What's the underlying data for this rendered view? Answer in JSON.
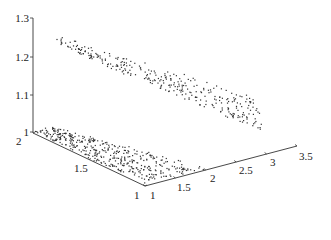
{
  "chart_data": {
    "type": "scatter3d",
    "title": "",
    "xlabel": "",
    "ylabel": "",
    "zlabel": "",
    "grid": false,
    "legend": null,
    "axes": {
      "z": {
        "range": [
          1,
          1.3
        ],
        "ticks": [
          "1",
          "1.1",
          "1.2",
          "1.3"
        ]
      },
      "x": {
        "range": [
          1,
          2
        ],
        "ticks": [
          "2",
          "1.5",
          "1"
        ]
      },
      "y": {
        "range": [
          1,
          3.5
        ],
        "ticks": [
          "1",
          "1.5",
          "2",
          "2.5",
          "3",
          "3.5"
        ]
      }
    },
    "series": [
      {
        "name": "upper-surface",
        "description": "tilted sheet of points descending from z≈1.25 at (x=2,y=1) toward z≈1.0 at large y",
        "approx_count": 320
      },
      {
        "name": "floor-plane",
        "description": "dense points on z=1 floor over x∈[1,2], y∈[1,~2]",
        "approx_count": 420
      }
    ]
  },
  "layout": {
    "z_axis_px": {
      "x": 33,
      "top": 18,
      "bottom": 132
    },
    "z_ticks_px": [
      {
        "label": "1",
        "y": 132
      },
      {
        "label": "1.1",
        "y": 95
      },
      {
        "label": "1.2",
        "y": 57
      },
      {
        "label": "1.3",
        "y": 18
      }
    ],
    "left_axis_px": {
      "x1": 33,
      "y1": 133,
      "x2": 145,
      "y2": 186
    },
    "left_ticks_px": [
      {
        "label": "2",
        "x": 16,
        "y": 145
      },
      {
        "label": "1.5",
        "x": 74,
        "y": 172
      },
      {
        "label": "1",
        "x": 134,
        "y": 199
      }
    ],
    "right_axis_px": {
      "x1": 145,
      "y1": 186,
      "x2": 297,
      "y2": 146
    },
    "right_ticks_px": [
      {
        "label": "1",
        "x": 150,
        "y": 199
      },
      {
        "label": "1.5",
        "x": 177,
        "y": 191
      },
      {
        "label": "2",
        "x": 210,
        "y": 182
      },
      {
        "label": "2.5",
        "x": 239,
        "y": 174
      },
      {
        "label": "3",
        "x": 270,
        "y": 166
      },
      {
        "label": "3.5",
        "x": 299,
        "y": 160
      }
    ],
    "point_color": "#333333"
  }
}
